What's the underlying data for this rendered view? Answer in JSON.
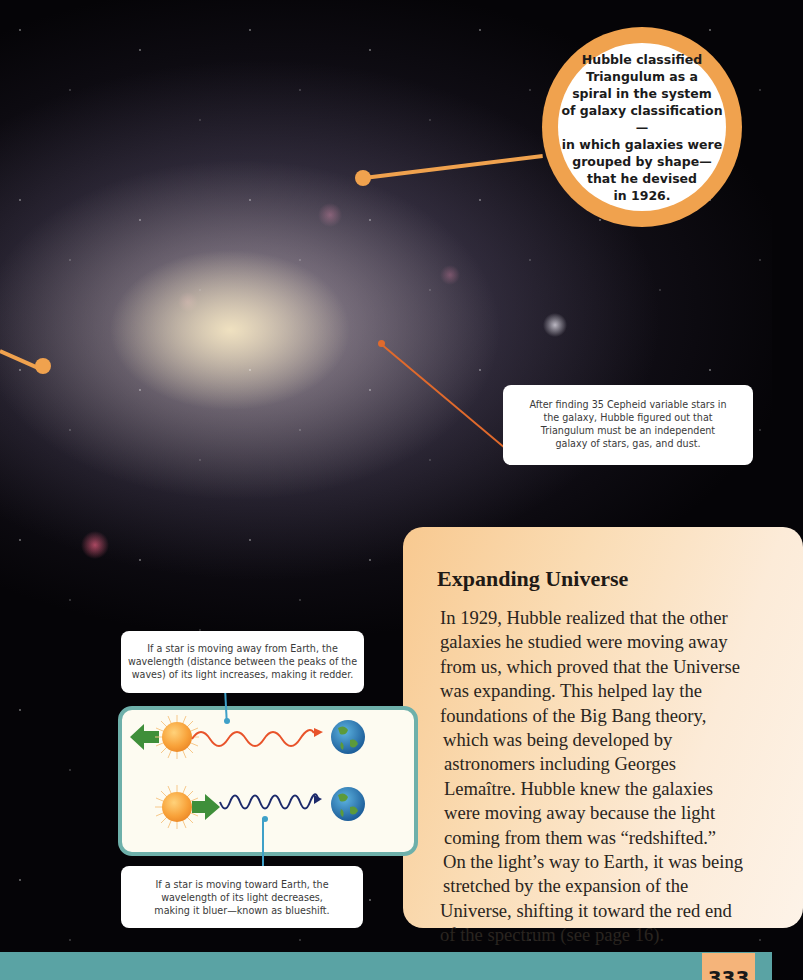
{
  "background": {
    "description": "Triangulum galaxy photograph on black starfield",
    "colors": {
      "space": "#050407",
      "pointer": "#f0a24e",
      "thin_pointer": "#e06a2c"
    }
  },
  "callouts": {
    "classification_bubble": {
      "text": "Hubble classified Triangulum as a spiral in the system of galaxy classification— in which galaxies were grouped by shape— that he devised in 1926.",
      "lines": [
        "Hubble classified",
        "Triangulum as a",
        "spiral in the system",
        "of galaxy classification—",
        "in which galaxies were",
        "grouped by shape—",
        "that he devised",
        "in 1926."
      ]
    },
    "cepheid_caption": {
      "lines": [
        "After finding 35 Cepheid variable stars in",
        "the galaxy, Hubble figured out that",
        "Triangulum must be an independent",
        "galaxy of stars, gas, and dust."
      ]
    }
  },
  "article": {
    "title": "Expanding Universe",
    "body_lines": [
      "In 1929, Hubble realized that the other",
      "galaxies he studied were moving away",
      "from us, which proved that the Universe",
      "was expanding. This helped lay the",
      "foundations of the Big Bang theory,",
      "which was being developed by",
      "astronomers including Georges",
      "Lemaître. Hubble knew the galaxies",
      "were moving away because the light",
      "coming from them was “redshifted.”",
      "On the light’s way to Earth, it was being",
      "stretched by the expansion of the",
      "Universe, shifting it toward the red end",
      "of the spectrum (see page 16)."
    ],
    "colors": {
      "panel_start": "#f8c990",
      "panel_end": "#fdf3e8"
    }
  },
  "diagram": {
    "redshift_caption": {
      "lines": [
        "If a star is moving away from Earth, the",
        "wavelength (distance between the peaks of the",
        "waves) of its light increases, making it redder."
      ]
    },
    "blueshift_caption": {
      "lines": [
        "If a star is moving toward Earth, the",
        "wavelength of its light decreases,",
        "making it bluer—known as blueshift."
      ]
    },
    "rows": [
      {
        "name": "redshift",
        "arrow": "left",
        "wave_color": "#e8532a",
        "arrow_color": "#3f8f3a"
      },
      {
        "name": "blueshift",
        "arrow": "right",
        "wave_color": "#1d2a6b",
        "arrow_color": "#3f8f3a"
      }
    ],
    "border_color": "#6eb0aa"
  },
  "footer": {
    "band_color": "#5aa3a4",
    "page_number": "333",
    "tab_color": "#f5b47a"
  }
}
